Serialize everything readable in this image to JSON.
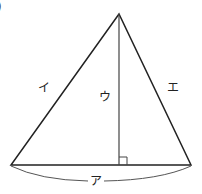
{
  "diagram": {
    "type": "triangle-with-altitude",
    "corner_mark": ")",
    "labels": {
      "base": "ア",
      "left_side": "イ",
      "altitude": "ウ",
      "right_side": "エ"
    },
    "vertices": {
      "apex": [
        119,
        14
      ],
      "bottom_left": [
        11,
        165
      ],
      "bottom_right": [
        191,
        165
      ]
    },
    "altitude_foot": [
      119,
      165
    ],
    "right_angle_marker_size": 8,
    "colors": {
      "stroke": "#222222",
      "brace": "#555555",
      "background": "#ffffff"
    }
  }
}
